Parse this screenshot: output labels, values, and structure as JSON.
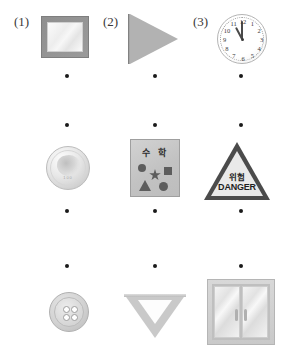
{
  "worksheet": {
    "labels": [
      {
        "text": "(1)",
        "x": 14,
        "y": 14
      },
      {
        "text": "(2)",
        "x": 103,
        "y": 14
      },
      {
        "text": "(3)",
        "x": 193,
        "y": 14
      }
    ],
    "dot_rows": [
      {
        "y": 76,
        "xs": [
          67,
          155,
          241
        ]
      },
      {
        "y": 125,
        "xs": [
          67,
          155,
          241
        ]
      },
      {
        "y": 211,
        "xs": [
          67,
          155,
          241
        ]
      },
      {
        "y": 266,
        "xs": [
          67,
          155,
          241
        ]
      }
    ],
    "items": [
      {
        "name": "mirror",
        "label": "mirror",
        "x": 41,
        "y": 16
      },
      {
        "name": "flag",
        "label": "flag",
        "x": 128,
        "y": 14
      },
      {
        "name": "clock",
        "label": "clock",
        "x": 217,
        "y": 14
      },
      {
        "name": "coin",
        "label": "coin",
        "x": 46,
        "y": 146
      },
      {
        "name": "math-book",
        "label": "math workbook",
        "x": 130,
        "y": 139
      },
      {
        "name": "danger-sign",
        "label": "danger sign",
        "x": 204,
        "y": 142
      },
      {
        "name": "button",
        "label": "button",
        "x": 49,
        "y": 292
      },
      {
        "name": "set-square",
        "label": "set square",
        "x": 124,
        "y": 294
      },
      {
        "name": "glass-door",
        "label": "glass door",
        "x": 207,
        "y": 279
      }
    ]
  },
  "clock": {
    "numbers": [
      "12",
      "1",
      "2",
      "3",
      "4",
      "5",
      "6",
      "7",
      "8",
      "9",
      "10",
      "11"
    ],
    "hour_hand_deg": 332,
    "minute_hand_deg": 0,
    "time": "11:00"
  },
  "math_book": {
    "title": "수 학",
    "shapes": [
      "circle",
      "star",
      "square",
      "triangle",
      "circle"
    ]
  },
  "danger_sign": {
    "korean": "위험",
    "english": "DANGER"
  },
  "coin": {
    "inscription": "100"
  },
  "button_item": {
    "holes": 4
  },
  "colors": {
    "background": "#ffffff",
    "dot": "#1a1a1a",
    "label_text": "#3a3a3a",
    "metal_light": "#e8e8e8",
    "metal_dark": "#9a9a9a",
    "sign_border": "#4b4b4b",
    "sign_face": "#e9e9e9"
  }
}
